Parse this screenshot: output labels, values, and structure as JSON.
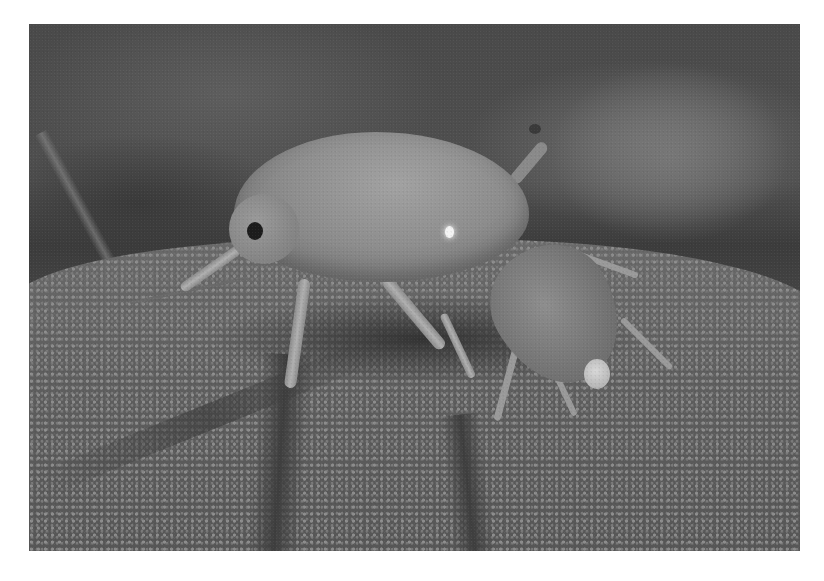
{
  "image": {
    "subject": "aphid-with-nymph-on-leaf",
    "colors": {
      "background_dark": "#3c3c3c",
      "background_mid": "#555555",
      "leaf_surface": "#6a6a6a",
      "aphid_body": "#8e8e8e",
      "highlight": "#f4f4f4",
      "eye": "#1c1c1c",
      "page_margin": "#ffffff"
    }
  }
}
